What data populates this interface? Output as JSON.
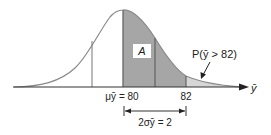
{
  "diagram": {
    "type": "normal-distribution",
    "region_label": "A",
    "tail_label": "P(ȳ > 82)",
    "axis_label": "ȳ",
    "mean_label": "μȳ = 80",
    "tick_82": "82",
    "width_label": "2σȳ = 2",
    "colors": {
      "curve": "#8a8a8a",
      "dark_fill": "#a6a6a6",
      "light_fill": "#d6d6d6",
      "axis": "#333333"
    }
  }
}
